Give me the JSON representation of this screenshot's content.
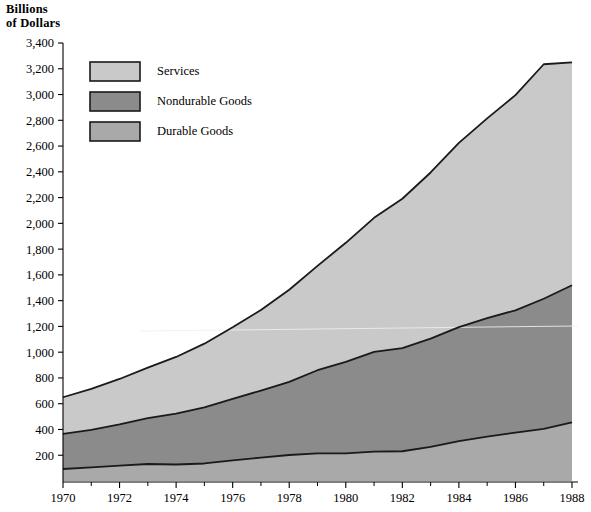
{
  "chart_data": {
    "type": "area",
    "title_line1": "Billions",
    "title_line2": "of Dollars",
    "xlabel": "",
    "ylabel": "Billions of Dollars",
    "stacked": true,
    "grid": false,
    "legend_position": "top-left",
    "xlim": [
      1970,
      1988
    ],
    "ylim": [
      0,
      3400
    ],
    "x": [
      1970,
      1971,
      1972,
      1973,
      1974,
      1975,
      1976,
      1977,
      1978,
      1979,
      1980,
      1981,
      1982,
      1983,
      1984,
      1985,
      1986,
      1987,
      1988
    ],
    "xticks": [
      1970,
      1972,
      1974,
      1976,
      1978,
      1980,
      1982,
      1984,
      1986,
      1988
    ],
    "xtick_labels": [
      "1970",
      "1972",
      "1974",
      "1976",
      "1978",
      "1980",
      "1982",
      "1984",
      "1986",
      "1988"
    ],
    "xticks_minor": [
      1971,
      1973,
      1975,
      1977,
      1979,
      1981,
      1983,
      1985,
      1987
    ],
    "yticks": [
      200,
      400,
      600,
      800,
      1000,
      1200,
      1400,
      1600,
      1800,
      2000,
      2200,
      2400,
      2600,
      2800,
      3000,
      3200,
      3400
    ],
    "ytick_labels": [
      "200",
      "400",
      "600",
      "800",
      "1,000",
      "1,200",
      "1,400",
      "1,600",
      "1,800",
      "2,000",
      "2,200",
      "2,400",
      "2,600",
      "2,800",
      "3,000",
      "3,200",
      "3,400"
    ],
    "series": [
      {
        "name": "Durable Goods",
        "color": "#a9a9a9",
        "stack_order": 1,
        "values": [
          93,
          105,
          120,
          132,
          128,
          136,
          160,
          182,
          202,
          215,
          214,
          228,
          231,
          265,
          310,
          345,
          375,
          405,
          455
        ]
      },
      {
        "name": "Nondurable Goods",
        "color": "#8b8b8b",
        "stack_order": 2,
        "values": [
          272,
          292,
          320,
          356,
          395,
          435,
          478,
          520,
          568,
          645,
          710,
          775,
          800,
          840,
          885,
          920,
          950,
          1010,
          1065
        ]
      },
      {
        "name": "Services",
        "color": "#c9c9c9",
        "stack_order": 3,
        "values": [
          285,
          318,
          352,
          392,
          440,
          495,
          555,
          625,
          715,
          810,
          925,
          1040,
          1160,
          1290,
          1430,
          1550,
          1670,
          1820,
          1730
        ]
      }
    ],
    "cumulative": {
      "durable": [
        93,
        105,
        120,
        132,
        128,
        136,
        160,
        182,
        202,
        215,
        214,
        228,
        231,
        265,
        310,
        345,
        375,
        405,
        455
      ],
      "durable_plus_nondurable": [
        365,
        397,
        440,
        488,
        523,
        571,
        638,
        702,
        770,
        860,
        924,
        1003,
        1031,
        1105,
        1195,
        1265,
        1325,
        1415,
        1520
      ],
      "total": [
        650,
        715,
        792,
        880,
        963,
        1066,
        1193,
        1327,
        1485,
        1670,
        1849,
        2043,
        2191,
        2395,
        2625,
        2815,
        2995,
        3235,
        3250
      ]
    }
  },
  "legend": {
    "items": [
      {
        "label": "Services",
        "color": "#c9c9c9"
      },
      {
        "label": "Nondurable Goods",
        "color": "#8b8b8b"
      },
      {
        "label": "Durable Goods",
        "color": "#a9a9a9"
      }
    ]
  },
  "colors": {
    "services": "#c9c9c9",
    "nondurable_goods": "#8b8b8b",
    "durable_goods": "#a9a9a9",
    "outline": "#1a1a1a",
    "axis": "#000000",
    "background": "#ffffff"
  }
}
